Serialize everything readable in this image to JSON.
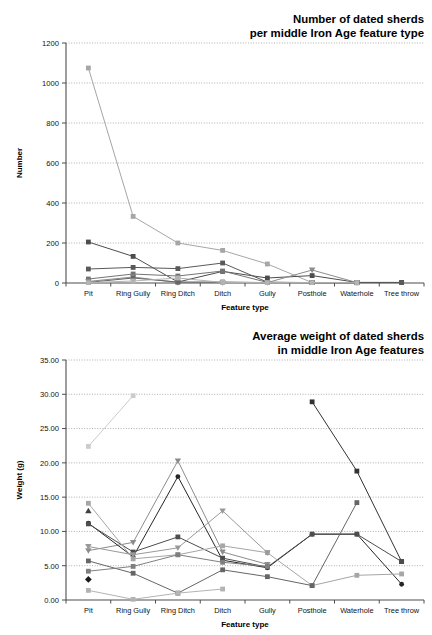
{
  "figure": {
    "background": "#ffffff",
    "grid_color": "#8c8c8c",
    "axis_color": "#4d4d4d"
  },
  "chart_data": [
    {
      "id": "sherd-count-chart",
      "type": "line",
      "title_line1": "Number of dated sherds",
      "title_line2": "per middle Iron Age feature type",
      "xlabel": "Feature type",
      "ylabel": "Number",
      "categories": [
        "Pit",
        "Ring Gully",
        "Ring Ditch",
        "Ditch",
        "Gully",
        "Posthole",
        "Waterhole",
        "Tree throw"
      ],
      "ylim": [
        0,
        1200
      ],
      "yticks": [
        0,
        200,
        400,
        600,
        800,
        1000,
        1200
      ],
      "ytick_labels": [
        "0",
        "200",
        "400",
        "600",
        "800",
        "1000",
        "1200"
      ],
      "grid": true,
      "legend": "none",
      "series": [
        {
          "name": "Site A",
          "color": "#a6a6a6",
          "marker": "square",
          "values": [
            1075,
            333,
            200,
            163,
            95,
            2,
            2,
            null
          ]
        },
        {
          "name": "Site B",
          "color": "#4d4d4d",
          "marker": "square",
          "values": [
            205,
            133,
            5,
            58,
            25,
            37,
            3,
            3
          ]
        },
        {
          "name": "Site C",
          "color": "#595959",
          "marker": "square",
          "values": [
            70,
            78,
            72,
            100,
            4,
            2,
            2,
            2
          ]
        },
        {
          "name": "Site D",
          "color": "#737373",
          "marker": "square",
          "values": [
            20,
            45,
            35,
            60,
            3,
            2,
            1,
            null
          ]
        },
        {
          "name": "Site E",
          "color": "#8c8c8c",
          "marker": "triangle-down",
          "values": [
            8,
            30,
            2,
            2,
            2,
            65,
            2,
            null
          ]
        },
        {
          "name": "Site F",
          "color": "#666666",
          "marker": "square",
          "values": [
            3,
            25,
            5,
            5,
            2,
            2,
            2,
            null
          ]
        },
        {
          "name": "Site G",
          "color": "#b3b3b3",
          "marker": "square",
          "values": [
            2,
            10,
            25,
            3,
            2,
            2,
            2,
            null
          ]
        }
      ]
    },
    {
      "id": "sherd-weight-chart",
      "type": "line",
      "title_line1": "Average weight of dated sherds",
      "title_line2": "in middle Iron Age features",
      "xlabel": "Feature type",
      "ylabel": "Weight (g)",
      "categories": [
        "Pit",
        "Ring Gully",
        "Ring Ditch",
        "Ditch",
        "Gully",
        "Posthole",
        "Waterhole",
        "Tree throw"
      ],
      "ylim": [
        0,
        35
      ],
      "yticks": [
        0,
        5,
        10,
        15,
        20,
        25,
        30,
        35
      ],
      "ytick_labels": [
        "0.00",
        "5.00",
        "10.00",
        "15.00",
        "20.00",
        "25.00",
        "30.00",
        "35.00"
      ],
      "grid": true,
      "legend": "none",
      "series": [
        {
          "name": "Site A",
          "color": "#cccccc",
          "marker": "square",
          "values": [
            22.4,
            29.8,
            null,
            null,
            null,
            null,
            null,
            null
          ]
        },
        {
          "name": "Site B",
          "color": "#333333",
          "marker": "square",
          "values": [
            null,
            null,
            null,
            null,
            null,
            28.9,
            18.8,
            5.6
          ]
        },
        {
          "name": "Site C",
          "color": "#8c8c8c",
          "marker": "triangle-down",
          "values": [
            7.2,
            8.4,
            20.3,
            7.0,
            5.2,
            null,
            null,
            null
          ]
        },
        {
          "name": "Site D",
          "color": "#262626",
          "marker": "circle",
          "values": [
            11.2,
            6.3,
            18.0,
            5.8,
            4.7,
            9.6,
            9.6,
            2.3
          ]
        },
        {
          "name": "Site E",
          "color": "#4d4d4d",
          "marker": "square",
          "values": [
            11.1,
            7.0,
            9.2,
            6.1,
            4.8,
            9.6,
            9.6,
            5.6
          ]
        },
        {
          "name": "Site F",
          "color": "#a6a6a6",
          "marker": "square",
          "values": [
            14.1,
            6.0,
            6.6,
            7.9,
            6.9,
            2.1,
            3.6,
            3.8
          ]
        },
        {
          "name": "Site G",
          "color": "#666666",
          "marker": "square",
          "values": [
            5.7,
            3.9,
            1.0,
            4.4,
            3.4,
            2.1,
            14.2,
            null
          ]
        },
        {
          "name": "Site H",
          "color": "#999999",
          "marker": "triangle-down",
          "values": [
            7.8,
            6.6,
            7.6,
            13.0,
            6.9,
            null,
            null,
            null
          ]
        },
        {
          "name": "Site I",
          "color": "#b3b3b3",
          "marker": "square",
          "values": [
            1.4,
            0.1,
            1.0,
            1.6,
            null,
            null,
            null,
            null
          ]
        },
        {
          "name": "Site J",
          "color": "#1a1a1a",
          "marker": "diamond",
          "values": [
            3.0,
            null,
            null,
            null,
            null,
            null,
            null,
            null
          ]
        },
        {
          "name": "Site K",
          "color": "#404040",
          "marker": "triangle-up",
          "values": [
            13.0,
            null,
            null,
            null,
            null,
            null,
            null,
            null
          ]
        },
        {
          "name": "Site L",
          "color": "#7f7f7f",
          "marker": "square",
          "values": [
            4.2,
            4.9,
            6.6,
            5.5,
            4.9,
            null,
            null,
            null
          ]
        }
      ]
    }
  ]
}
